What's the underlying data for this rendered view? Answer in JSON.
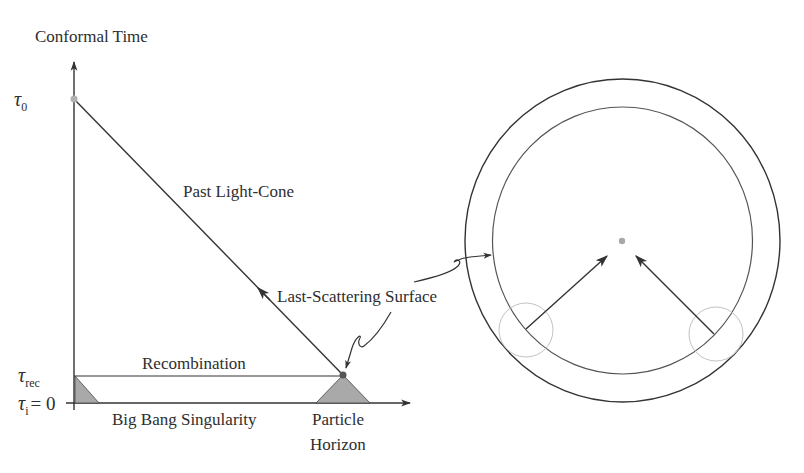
{
  "diagram": {
    "left_panel": {
      "y_axis_label": "Conformal Time",
      "ticks": {
        "tau0": {
          "symbol": "τ",
          "subscript": "0"
        },
        "tau_rec": {
          "symbol": "τ",
          "subscript": "rec"
        },
        "tau_i": {
          "symbol": "τ",
          "subscript": "i",
          "equals": "= 0"
        }
      },
      "labels": {
        "past_light_cone": "Past Light-Cone",
        "last_scattering": "Last-Scattering Surface",
        "recombination": "Recombination",
        "big_bang": "Big Bang Singularity",
        "particle_horizon_line1": "Particle",
        "particle_horizon_line2": "Horizon"
      }
    },
    "right_panel": {
      "description": "Concentric circles: observer at center, last-scattering sphere (inner circle), two horizon-size patches with arrows pointing toward observer"
    },
    "colors": {
      "line": "#333333",
      "shade": "#a9a9a9",
      "dot": "#9a9a9a",
      "patch": "#bdbdbd"
    }
  }
}
